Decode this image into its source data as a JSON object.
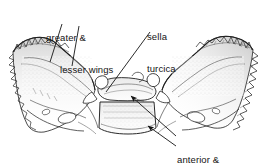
{
  "figure": {
    "view": "superior view",
    "medium": "pen-and-ink line drawing",
    "width": 266,
    "height": 163,
    "background_color": "#ffffff",
    "ink_color": "#141414"
  },
  "labels": {
    "wings": {
      "line1": "greater &",
      "line2": "lesser wings",
      "target": "greater-and-lesser-wings"
    },
    "sella": {
      "line1": "sella",
      "line2": "turcica",
      "target": "sella-turcica"
    },
    "clinoid": {
      "line1": "anterior &",
      "line2": "posterior clinoid",
      "target": "clinoid-processes"
    }
  },
  "leader_lines": [
    {
      "name": "leader-greater-wing",
      "from": [
        62,
        24
      ],
      "to": [
        50,
        62
      ],
      "arrow": false
    },
    {
      "name": "leader-lesser-wing",
      "from": [
        79,
        26
      ],
      "to": [
        72,
        66
      ],
      "arrow": false
    },
    {
      "name": "leader-sella-turcica",
      "from": [
        150,
        32
      ],
      "to": [
        106,
        92
      ],
      "arrow": false
    },
    {
      "name": "leader-anterior-clinoid",
      "from": [
        176,
        136
      ],
      "to": [
        131,
        96
      ],
      "arrow": true
    },
    {
      "name": "leader-posterior-clinoid",
      "from": [
        176,
        146
      ],
      "to": [
        148,
        126
      ],
      "arrow": true
    }
  ]
}
